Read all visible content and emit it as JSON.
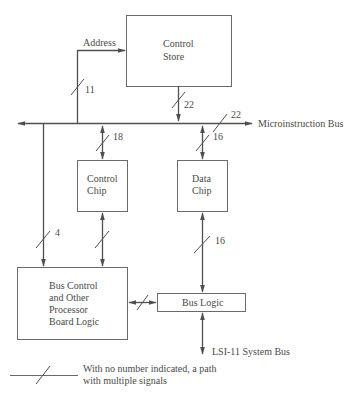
{
  "diagram": {
    "blocks": {
      "control_store": {
        "line1": "Control",
        "line2": "Store"
      },
      "control_chip": {
        "line1": "Control",
        "line2": "Chip"
      },
      "data_chip": {
        "line1": "Data",
        "line2": "Chip"
      },
      "bus_control": {
        "line1": "Bus Control",
        "line2": "and Other",
        "line3": "Processor",
        "line4": "Board Logic"
      },
      "bus_logic": {
        "label": "Bus Logic"
      }
    },
    "labels": {
      "address": "Address",
      "microinstruction_bus": "Microinstruction Bus",
      "system_bus": "LSI-11 System Bus"
    },
    "path_widths": {
      "address": "11",
      "store_to_bus": "22",
      "microinstruction_bus": "22",
      "bus_to_control_chip": "18",
      "bus_to_data_chip": "16",
      "bus_to_bus_control": "4",
      "data_chip_to_bus_logic": "16"
    },
    "legend": {
      "line1": "With no number indicated, a path",
      "line2": "with multiple signals"
    },
    "colors": {
      "line": "#4f4f4f",
      "box_border": "#6a6a6a",
      "text": "#4a4a4a",
      "background": "#ffffff"
    }
  }
}
